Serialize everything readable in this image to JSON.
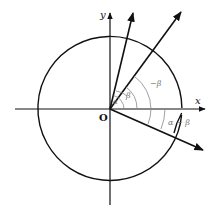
{
  "diagram": {
    "labels": {
      "x_axis": "x",
      "y_axis": "y",
      "origin": "O",
      "alpha": "α",
      "beta": "β",
      "neg_beta": "−β",
      "alpha_minus_beta": "α − β"
    },
    "geometry": {
      "origin": [
        110,
        109
      ],
      "circle_radius": 72,
      "vectors_deg": {
        "alpha": 75,
        "beta": 52,
        "alpha_minus_beta": -23
      }
    },
    "colors": {
      "ink": "#111111",
      "annotation": "#888888",
      "background": "#ffffff"
    }
  }
}
